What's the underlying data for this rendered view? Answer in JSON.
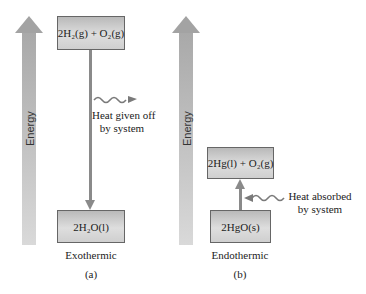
{
  "panels": [
    {
      "id": "a",
      "axis_label": "Energy",
      "upper_state": "2H₂(g) + O₂(g)",
      "lower_state": "2H₂O(l)",
      "heat_label_line1": "Heat given off",
      "heat_label_line2": "by system",
      "process": "Exothermic",
      "letter": "(a)"
    },
    {
      "id": "b",
      "axis_label": "Energy",
      "upper_state": "2Hg(l) + O₂(g)",
      "lower_state": "2HgO(s)",
      "heat_label_line1": "Heat absorbed",
      "heat_label_line2": "by system",
      "process": "Endothermic",
      "letter": "(b)"
    }
  ],
  "colors": {
    "energy_arrow": "#a9a9a9",
    "box_fill": "#d4d4d4",
    "connector": "#8a8a8a",
    "wavy_arrow": "#7a7a7a"
  }
}
